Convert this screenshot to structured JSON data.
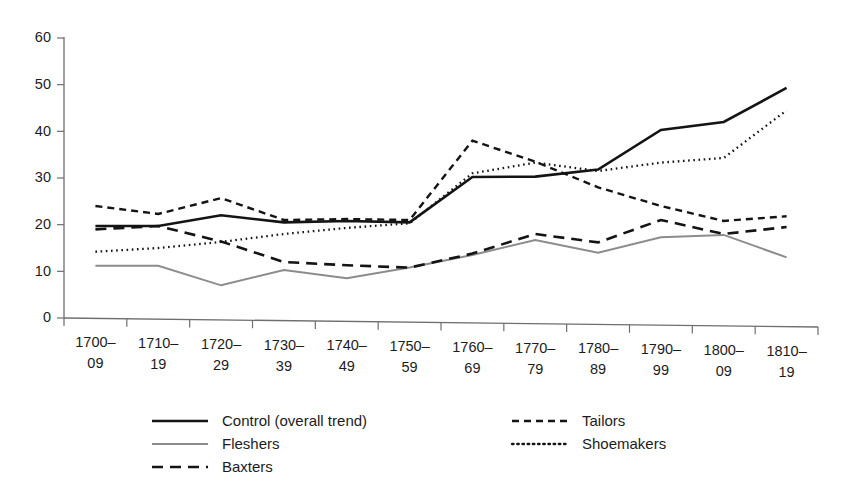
{
  "chart_data": {
    "type": "line",
    "title": "",
    "subtitle": "",
    "xlabel": "",
    "ylabel": "",
    "grid": false,
    "legend_position": "bottom",
    "xlim_categories": 12,
    "ylim": [
      0,
      60
    ],
    "ytick_values": [
      0,
      10,
      20,
      30,
      40,
      50,
      60
    ],
    "ytick_labels": [
      "0",
      "10",
      "20",
      "30",
      "40",
      "50",
      "60"
    ],
    "categories": [
      "1700–09",
      "1710–19",
      "1720–29",
      "1730–39",
      "1740–49",
      "1750–59",
      "1760–69",
      "1770–79",
      "1780–89",
      "1790–99",
      "1800–09",
      "1810–19"
    ],
    "category_lines": [
      [
        "1700–",
        "09"
      ],
      [
        "1710–",
        "19"
      ],
      [
        "1720–",
        "29"
      ],
      [
        "1730–",
        "39"
      ],
      [
        "1740–",
        "49"
      ],
      [
        "1750–",
        "59"
      ],
      [
        "1760–",
        "69"
      ],
      [
        "1770–",
        "79"
      ],
      [
        "1780–",
        "89"
      ],
      [
        "1790–",
        "99"
      ],
      [
        "1800–",
        "09"
      ],
      [
        "1810–",
        "19"
      ]
    ],
    "series": [
      {
        "name": "Control (overall trend)",
        "style": "solid",
        "color": "#141414",
        "width": 2.6,
        "dash": "none",
        "values": [
          19.7,
          19.7,
          22.0,
          20.5,
          20.8,
          20.5,
          30.2,
          30.3,
          31.8,
          40.3,
          42.0,
          49.3
        ]
      },
      {
        "name": "Fleshers",
        "style": "solid",
        "color": "#8c8c8c",
        "width": 2.0,
        "dash": "none",
        "values": [
          11.2,
          11.2,
          7.0,
          10.3,
          8.5,
          10.8,
          13.5,
          16.7,
          14.0,
          17.3,
          17.8,
          13.0
        ]
      },
      {
        "name": "Baxters",
        "style": "long-dash",
        "color": "#141414",
        "width": 2.6,
        "dash": "11 7",
        "values": [
          19.0,
          19.7,
          16.4,
          12.0,
          11.3,
          10.8,
          13.8,
          18.0,
          16.2,
          21.0,
          18.0,
          19.5
        ]
      },
      {
        "name": "Tailors",
        "style": "short-dash",
        "color": "#141414",
        "width": 2.4,
        "dash": "7 5",
        "values": [
          24.0,
          22.3,
          25.7,
          21.0,
          21.2,
          21.0,
          38.0,
          33.5,
          28.0,
          24.0,
          20.8,
          21.8
        ]
      },
      {
        "name": "Shoemakers",
        "style": "dotted",
        "color": "#141414",
        "width": 2.3,
        "dash": "1.6 3.6",
        "values": [
          14.2,
          15.0,
          16.3,
          18.0,
          19.3,
          20.3,
          31.0,
          33.3,
          31.5,
          33.3,
          34.3,
          44.5
        ]
      }
    ]
  },
  "legend": {
    "column_left": [
      {
        "label": "Control (overall trend)",
        "series": "Control (overall trend)"
      },
      {
        "label": "Fleshers",
        "series": "Fleshers"
      },
      {
        "label": "Baxters",
        "series": "Baxters"
      }
    ],
    "column_right": [
      {
        "label": "Tailors",
        "series": "Tailors"
      },
      {
        "label": "Shoemakers",
        "series": "Shoemakers"
      }
    ]
  },
  "colors": {
    "ink": "#141414",
    "gray_series": "#8c8c8c",
    "axis": "#6e6e6e",
    "background": "#ffffff"
  }
}
